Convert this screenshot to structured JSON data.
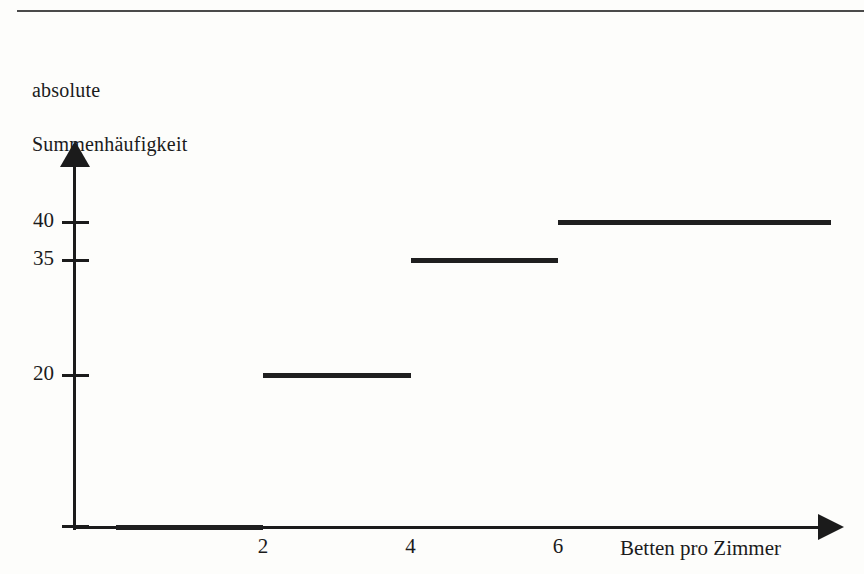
{
  "figure": {
    "y_axis_title_line1": "absolute",
    "y_axis_title_line2": "Summenhäufigkeit",
    "x_axis_title": "Betten pro Zimmer",
    "ink_color": "#1f1f1f",
    "rule_color": "#4a4a4a",
    "background": "#fdfdfb"
  },
  "chart_data": {
    "type": "line",
    "title": "",
    "subtitle": "",
    "xlabel": "Betten pro Zimmer",
    "ylabel": "absolute Summenhäufigkeit",
    "style": "empirical cumulative step function",
    "xlim": [
      0,
      8
    ],
    "ylim": [
      0,
      45
    ],
    "xticks": [
      2,
      4,
      6
    ],
    "xtick_labels": [
      "2",
      "4",
      "6"
    ],
    "yticks": [
      20,
      35,
      40
    ],
    "ytick_labels": [
      "20",
      "35",
      "40"
    ],
    "grid": false,
    "legend": null,
    "x": [
      0,
      2,
      4,
      6,
      8
    ],
    "values": [
      0,
      20,
      35,
      40,
      40
    ],
    "steps": [
      {
        "x_start": 0,
        "x_end": 2,
        "y": 0,
        "label": "0"
      },
      {
        "x_start": 2,
        "x_end": 4,
        "y": 20,
        "label": "20"
      },
      {
        "x_start": 4,
        "x_end": 6,
        "y": 35,
        "label": "35"
      },
      {
        "x_start": 6,
        "x_end": 9.7,
        "y": 40,
        "label": "40"
      }
    ]
  }
}
